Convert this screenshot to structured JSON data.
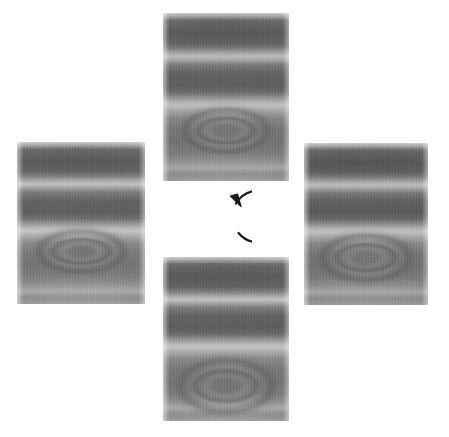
{
  "figure": {
    "title": "Rotation series of interference-fringe micrographs",
    "background_color": "#ffffff",
    "width": 449,
    "height": 437,
    "layout": "cross",
    "caption": ""
  },
  "center": {
    "icon_name": "clockwise-rotation-arrow-icon",
    "label": "",
    "direction": "clockwise",
    "stroke_color": "#1a1a1a",
    "gap_side": "right",
    "arrowhead_position": "top-right"
  },
  "panels": [
    {
      "id": "panel-top",
      "position": "top",
      "label": "",
      "orientation_deg": 0,
      "description": "Grayscale micrograph with horizontal interference fringes and a concentric oval feature in the lower half",
      "x": 163,
      "y": 13,
      "width": 126,
      "height": 168,
      "mean_tone": "#8d8d8d"
    },
    {
      "id": "panel-right",
      "position": "right",
      "label": "",
      "orientation_deg": 90,
      "description": "Grayscale micrograph with horizontal interference fringes and a broad concentric oval feature",
      "x": 304,
      "y": 143,
      "width": 124,
      "height": 162,
      "mean_tone": "#8b8b8b"
    },
    {
      "id": "panel-bottom",
      "position": "bottom",
      "label": "",
      "orientation_deg": 180,
      "description": "Grayscale micrograph with horizontal interference fringes and a wide concentric oval feature near the base",
      "x": 163,
      "y": 257,
      "width": 126,
      "height": 164,
      "mean_tone": "#8f8f8f"
    },
    {
      "id": "panel-left",
      "position": "left",
      "label": "",
      "orientation_deg": 270,
      "description": "Grayscale micrograph with horizontal interference fringes and a small concentric oval feature mid-low",
      "x": 17,
      "y": 142,
      "width": 128,
      "height": 162,
      "mean_tone": "#8c8c8c"
    }
  ],
  "colors": {
    "page_background": "#ffffff",
    "arrow_stroke": "#1a1a1a",
    "fringe_dark": "#5e5e5e",
    "fringe_light": "#c0c0c0",
    "panel_base": "#8d8d8d"
  }
}
